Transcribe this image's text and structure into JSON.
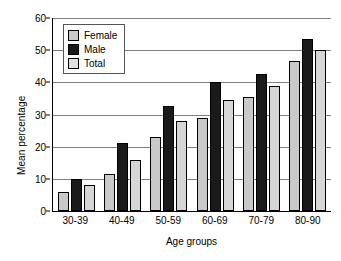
{
  "chart_data": {
    "type": "bar",
    "title": "",
    "xlabel": "Age groups",
    "ylabel": "Mean percentage",
    "categories": [
      "30-39",
      "40-49",
      "50-59",
      "60-69",
      "70-79",
      "80-90"
    ],
    "series": [
      {
        "name": "Female",
        "color": "#c9c9c9",
        "values": [
          6,
          11.5,
          23,
          29,
          35.5,
          46.5
        ]
      },
      {
        "name": "Male",
        "color": "#1a1a1a",
        "values": [
          10,
          21,
          32.5,
          40,
          42.5,
          53.5
        ]
      },
      {
        "name": "Total",
        "color": "#d6d6d6",
        "values": [
          8,
          16,
          28,
          34.5,
          39,
          50
        ]
      }
    ],
    "ylim": [
      0,
      60
    ],
    "ytick_labels": [
      "0",
      "10",
      "20",
      "30",
      "40",
      "50",
      "60"
    ],
    "ytick_values": [
      0,
      10,
      20,
      30,
      40,
      50,
      60
    ],
    "grid": "horizontal",
    "legend_position": "top-left"
  }
}
